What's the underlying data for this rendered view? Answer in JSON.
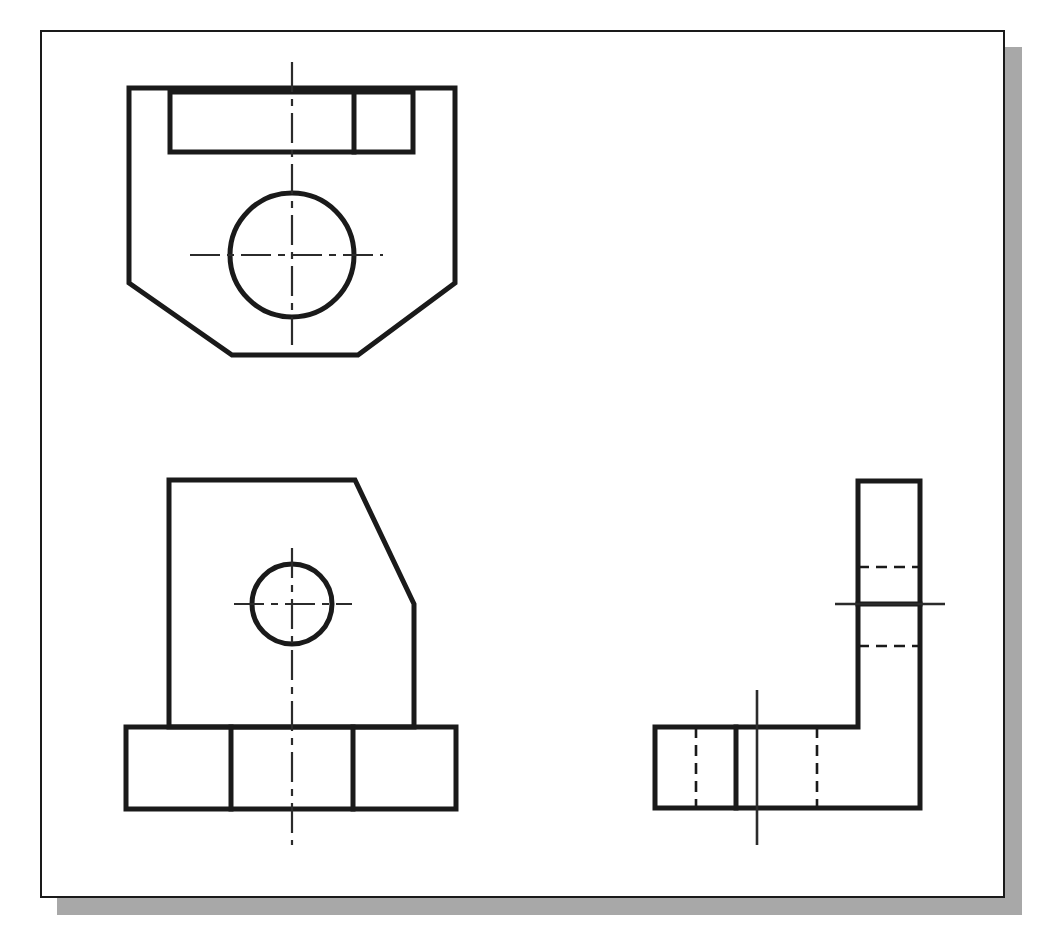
{
  "document": {
    "title": "Orthographic Multiview Engineering Drawing",
    "sheet_background": "#ffffff",
    "border_color": "#1a1a1a",
    "shadow_color": "#a8a8a8",
    "line_color": "#1a1a1a",
    "centerline_color": "#2b2b2b"
  },
  "sheet": {
    "x": 40,
    "y": 30,
    "width": 965,
    "height": 868,
    "border_width": 2,
    "shadow_offset_x": 17,
    "shadow_offset_y": 17
  },
  "views": {
    "top_view": {
      "name": "Top View",
      "outline_label": "top-view-outline",
      "outline_points": "129,88 455,88 455,283 358,355 232,355 129,283 129,88",
      "slot_points": "170,92 413,92 413,152 170,152 170,92",
      "slot_divider": {
        "x": 354,
        "y1": 92,
        "y2": 152
      },
      "hole": {
        "cx": 292,
        "cy": 255,
        "r": 62
      },
      "vertical_centerline": {
        "x": 292,
        "y1": 62,
        "y2": 345
      },
      "horizontal_centerline": {
        "y": 255,
        "x1": 190,
        "x2": 383
      }
    },
    "front_view": {
      "name": "Front View",
      "body_points": "169,480 355,480 414,604 414,727 169,727 169,480",
      "base_points": "126,727 456,727 456,809 126,809 126,727",
      "base_divider_left": {
        "x": 231,
        "y1": 727,
        "y2": 809
      },
      "base_divider_right": {
        "x": 353,
        "y1": 727,
        "y2": 809
      },
      "hole": {
        "cx": 292,
        "cy": 604,
        "r": 40
      },
      "vertical_centerline": {
        "x": 292,
        "y1": 548,
        "y2": 845
      },
      "horizontal_centerline": {
        "y": 604,
        "x1": 234,
        "x2": 352
      }
    },
    "side_view": {
      "name": "Right Side View",
      "outline_points": "858,481 920,481 920,808 655,808 655,727 858,727 858,481",
      "base_divider": {
        "x": 736,
        "y1": 727,
        "y2": 808
      },
      "column_solid_divider": {
        "y": 604,
        "x1": 858,
        "x2": 920
      },
      "hidden_lines": [
        {
          "label": "column-upper-hidden",
          "x1": 858,
          "y1": 567,
          "x2": 920,
          "y2": 567
        },
        {
          "label": "column-lower-hidden",
          "x1": 858,
          "y1": 646,
          "x2": 920,
          "y2": 646
        },
        {
          "label": "base-left-hidden",
          "x1": 696,
          "y1": 727,
          "x2": 696,
          "y2": 808
        },
        {
          "label": "base-right-hidden",
          "x1": 817,
          "y1": 727,
          "x2": 817,
          "y2": 808
        }
      ],
      "horizontal_centerline": {
        "y": 604,
        "x1": 835,
        "x2": 945
      },
      "vertical_centerline": {
        "x": 757,
        "y1": 690,
        "y2": 845
      }
    }
  },
  "legend": {
    "visible_edge": "continuous thick line",
    "hidden_edge": "dashed thin line",
    "center_line": "long-dash short-dash chain line"
  }
}
